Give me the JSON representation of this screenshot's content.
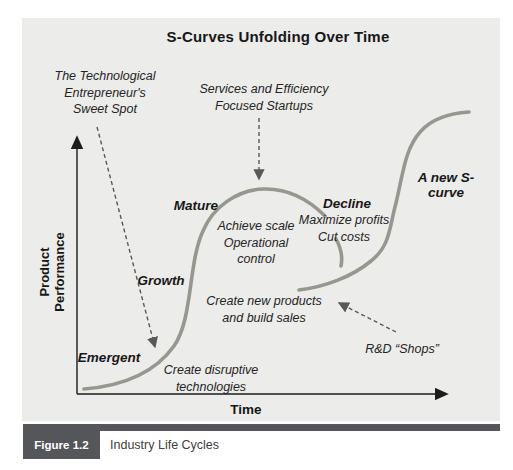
{
  "figure": {
    "title": "S-Curves Unfolding Over Time",
    "y_axis_label": "Product\nPerformance",
    "x_axis_label": "Time",
    "stage_labels": {
      "emergent": "Emergent",
      "growth": "Growth",
      "mature": "Mature",
      "decline": "Decline",
      "new_s_curve": "A new S-curve"
    },
    "annotations": {
      "sweet_spot": "The Technological\nEntrepreneur's\nSweet Spot",
      "services_startups": "Services and Efficiency\nFocused Startups",
      "achieve_scale": "Achieve scale\nOperational\ncontrol",
      "maximize_profits": "Maximize profits\nCut costs",
      "create_new_products": "Create new products\nand build sales",
      "create_disruptive": "Create disruptive\ntechnologies",
      "rd_shops": "R&D “Shops”"
    },
    "caption": {
      "label": "Figure 1.2",
      "text": "Industry Life Cycles"
    },
    "colors": {
      "figure_background": "#ececea",
      "curve_gray": "#97978f",
      "dashed_arrow_gray": "#58585a",
      "axis_black": "#1c1c1c",
      "caption_bar_gray": "#54565a",
      "caption_label_text": "#ffffff"
    }
  }
}
